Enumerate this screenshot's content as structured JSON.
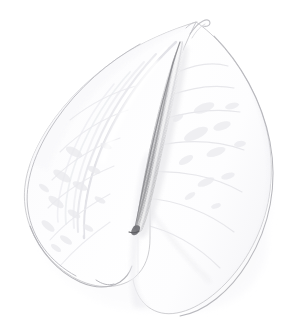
{
  "image": {
    "subject": "Anthurium flower",
    "common_name": "Flamingo flower",
    "description": "White anthurium spathe with pale textured spadix on a white background",
    "background_color": "#ffffff",
    "width": 294,
    "height": 335
  },
  "palette": {
    "background": "#ffffff",
    "spathe_fill": "#fefefe",
    "spathe_outline": "#b9b9bd",
    "spathe_outline_soft": "#d6d6da",
    "spathe_shadow": "#f2f2f4",
    "vein_color": "#eaeaee",
    "fold_color": "#e4e4e8",
    "spadix_dark": "#969699",
    "spadix_mid": "#bcbcbe",
    "spadix_light": "#e9e9eb",
    "spadix_base_dark": "#6e6e70",
    "tail_color": "#c9c9cd"
  },
  "parts": {
    "left_lobe": {
      "label": "Left spathe lobe",
      "leftmost_x": 23,
      "bottom_y": 288
    },
    "right_lobe": {
      "label": "Right spathe lobe",
      "rightmost_x": 272,
      "bottom_y": 316
    },
    "spadix": {
      "label": "Spadix (central spike)",
      "top_x": 180,
      "top_y": 42,
      "base_x": 139,
      "base_y": 230,
      "texture": "fine diamond grid"
    },
    "apex_tail": {
      "label": "Spathe apex tail",
      "x": 200,
      "y": 22
    }
  },
  "notes": {
    "lighting": "flat high-key, near-blown highlights",
    "contrast": "very low; subject nearly the same value as the background"
  }
}
